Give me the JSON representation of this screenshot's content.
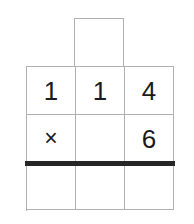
{
  "worksheet": {
    "type": "long-multiplication-grid",
    "title": "Long multiplication worksheet grid",
    "problem": "114 × 6",
    "columns": 3,
    "colors": {
      "grid_border": "#b0b0b0",
      "answer_rule": "#262626",
      "digit": "#1a1a1a",
      "background": "#ffffff"
    },
    "carry_row": {
      "label": "carry-row",
      "cells": [
        {
          "column": "tens",
          "value": ""
        }
      ]
    },
    "rows": [
      {
        "label": "multiplicand-row",
        "cells": [
          {
            "value": "1",
            "kind": "digit"
          },
          {
            "value": "1",
            "kind": "digit"
          },
          {
            "value": "4",
            "kind": "digit"
          }
        ]
      },
      {
        "label": "multiplier-row",
        "cells": [
          {
            "value": "×",
            "kind": "operator"
          },
          {
            "value": "",
            "kind": "blank"
          },
          {
            "value": "6",
            "kind": "digit"
          }
        ]
      },
      {
        "label": "answer-row",
        "cells": [
          {
            "value": "",
            "kind": "blank"
          },
          {
            "value": "",
            "kind": "blank"
          },
          {
            "value": "",
            "kind": "blank"
          }
        ]
      }
    ]
  }
}
